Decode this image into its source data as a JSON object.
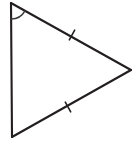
{
  "figure": {
    "kind": "geometry-diagram",
    "shape_name": "triangle",
    "background_color": "#ffffff",
    "stroke_color": "#231f20",
    "arc_color": "#3a3a3c",
    "canvas": {
      "width": 136,
      "height": 150
    },
    "vertices": [
      {
        "id": "A",
        "label": "",
        "x": 11,
        "y": 3
      },
      {
        "id": "B",
        "label": "",
        "x": 131,
        "y": 70
      },
      {
        "id": "C",
        "label": "",
        "x": 12,
        "y": 137
      }
    ],
    "sides": [
      {
        "id": "AB",
        "from": "A",
        "to": "B",
        "tick_count": 1
      },
      {
        "id": "BC",
        "from": "B",
        "to": "C",
        "tick_count": 1
      },
      {
        "id": "CA",
        "from": "C",
        "to": "A",
        "tick_count": 0
      }
    ],
    "angle_marks": [
      {
        "id": "angle-A",
        "at_vertex": "A",
        "label": "",
        "arc_count": 1,
        "radius": 16
      }
    ],
    "tick_marks": [
      {
        "id": "tick-upper",
        "on_side": "AB",
        "x": 72,
        "y": 35,
        "length": 11
      },
      {
        "id": "tick-lower",
        "on_side": "BC",
        "x": 68,
        "y": 107,
        "length": 11
      }
    ]
  }
}
